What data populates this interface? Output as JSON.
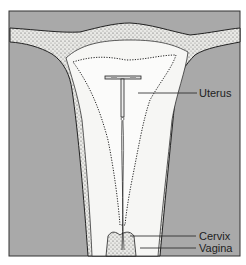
{
  "figure": {
    "background_color": "#a9a9a9",
    "tissue_color": "#f4f4f2",
    "outline_color": "#222222"
  },
  "labels": [
    {
      "id": "uterus",
      "text": "Uterus"
    },
    {
      "id": "cervix",
      "text": "Cervix"
    },
    {
      "id": "vagina",
      "text": "Vagina"
    }
  ]
}
